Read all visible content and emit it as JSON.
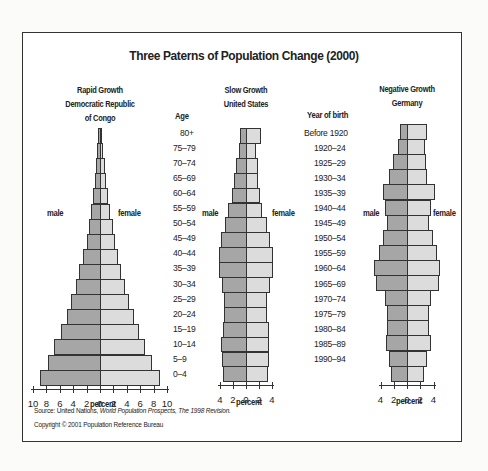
{
  "title": "Three Paterns of Population Change (2000)",
  "age_header": "Age",
  "birth_header": "Year of birth",
  "source_prefix": "Source: United Nations, ",
  "source_italic": "World Population Prospects, The 1998 Revision.",
  "copyright": "Copyright © 2001 Population Reference Bureau",
  "chart_data": [
    {
      "type": "bar",
      "orientation": "horizontal-population-pyramid",
      "title": "Rapid Growth",
      "subtitle": "Democratic Republic of Congo",
      "subtitle_lines": [
        "Rapid Growth",
        "Democratic Republic",
        "of Congo"
      ],
      "xlabel": "percent",
      "male_label": "male",
      "female_label": "female",
      "xlim": [
        -10,
        10
      ],
      "xticks": [
        "10",
        "8",
        "6",
        "4",
        "2",
        "0",
        "2",
        "4",
        "6",
        "8",
        "10"
      ],
      "categories": [
        "80+",
        "75–79",
        "70–74",
        "65–69",
        "60–64",
        "55–59",
        "50–54",
        "45–49",
        "40–44",
        "35–39",
        "30–34",
        "25–29",
        "20–24",
        "15–19",
        "10–14",
        "5–9",
        "0–4"
      ],
      "series": [
        {
          "name": "male",
          "color": "#a6a6a6",
          "values": [
            0.3,
            0.4,
            0.6,
            0.8,
            1.1,
            1.3,
            1.7,
            2.0,
            2.5,
            3.1,
            3.6,
            4.3,
            5.0,
            5.8,
            6.8,
            7.8,
            9.0
          ]
        },
        {
          "name": "female",
          "color": "#dcdcdc",
          "values": [
            0.3,
            0.5,
            0.7,
            0.9,
            1.2,
            1.5,
            1.9,
            2.2,
            2.7,
            3.2,
            3.7,
            4.3,
            5.0,
            5.8,
            6.7,
            7.7,
            8.9
          ]
        }
      ]
    },
    {
      "type": "bar",
      "orientation": "horizontal-population-pyramid",
      "title": "Slow Growth",
      "subtitle": "United States",
      "subtitle_lines": [
        "Slow Growth",
        "United States"
      ],
      "xlabel": "percent",
      "male_label": "male",
      "female_label": "female",
      "xlim": [
        -4,
        4
      ],
      "xticks": [
        "4",
        "2",
        "0",
        "2",
        "4"
      ],
      "categories": [
        "80+",
        "75–79",
        "70–74",
        "65–69",
        "60–64",
        "55–59",
        "50–54",
        "45–49",
        "40–44",
        "35–39",
        "30–34",
        "25–29",
        "20–24",
        "15–19",
        "10–14",
        "5–9",
        "0–4"
      ],
      "series": [
        {
          "name": "male",
          "color": "#a6a6a6",
          "values": [
            1.0,
            1.2,
            1.5,
            1.7,
            2.0,
            2.3,
            3.0,
            3.5,
            4.1,
            4.1,
            3.6,
            3.4,
            3.4,
            3.6,
            3.8,
            3.7,
            3.5
          ]
        },
        {
          "name": "female",
          "color": "#dcdcdc",
          "values": [
            2.1,
            1.5,
            1.8,
            1.9,
            2.1,
            2.4,
            3.0,
            3.5,
            4.1,
            4.1,
            3.6,
            3.4,
            3.3,
            3.5,
            3.6,
            3.5,
            3.4
          ]
        }
      ]
    },
    {
      "type": "bar",
      "orientation": "horizontal-population-pyramid",
      "title": "Negative Growth",
      "subtitle": "Germany",
      "subtitle_lines": [
        "Negative Growth",
        "Germany"
      ],
      "xlabel": "percent",
      "male_label": "male",
      "female_label": "female",
      "xlim": [
        -4,
        4
      ],
      "xticks": [
        "4",
        "2",
        "0",
        "2",
        "4"
      ],
      "row_labels_title": "Year of birth",
      "categories": [
        "Before 1920",
        "1920–24",
        "1925–29",
        "1930–34",
        "1935–39",
        "1940–44",
        "1945–49",
        "1950–54",
        "1955–59",
        "1960–64",
        "1965–69",
        "1970–74",
        "1975–79",
        "1980–84",
        "1985–89",
        "1990–94",
        "1995–99"
      ],
      "series": [
        {
          "name": "male",
          "color": "#a6a6a6",
          "values": [
            1.3,
            1.6,
            2.3,
            2.8,
            4.0,
            3.8,
            3.5,
            4.0,
            4.5,
            5.2,
            5.0,
            3.7,
            3.4,
            3.3,
            3.4,
            3.0,
            2.6
          ]
        },
        {
          "name": "female",
          "color": "#dcdcdc",
          "values": [
            3.1,
            2.7,
            2.9,
            3.1,
            4.0,
            3.7,
            3.4,
            4.0,
            4.4,
            5.0,
            4.8,
            3.6,
            3.2,
            3.1,
            3.3,
            2.9,
            2.5
          ]
        }
      ]
    }
  ],
  "display": {
    "congo": {
      "male": [
        0.3,
        0.4,
        0.6,
        0.8,
        1.1,
        1.3,
        1.7,
        2.0,
        2.5,
        3.1,
        3.6,
        4.3,
        5.0,
        5.8,
        6.8,
        7.8,
        9.0
      ],
      "female": [
        0.3,
        0.5,
        0.7,
        0.9,
        1.2,
        1.5,
        1.9,
        2.2,
        2.7,
        3.2,
        3.7,
        4.3,
        5.0,
        5.8,
        6.7,
        7.7,
        8.9
      ]
    },
    "us": {
      "male": [
        1.0,
        1.1,
        1.6,
        1.8,
        2.1,
        2.7,
        3.3,
        3.9,
        4.1,
        4.1,
        3.7,
        3.4,
        3.4,
        3.6,
        3.8,
        3.7,
        3.5
      ],
      "female": [
        2.3,
        1.5,
        1.8,
        1.8,
        2.1,
        2.5,
        3.2,
        3.7,
        4.1,
        4.1,
        3.7,
        3.3,
        3.3,
        3.5,
        3.6,
        3.6,
        3.4
      ]
    },
    "germany": {
      "male": [
        1.0,
        1.3,
        2.1,
        2.7,
        3.6,
        3.3,
        3.0,
        3.6,
        4.2,
        5.0,
        4.7,
        3.3,
        3.0,
        3.0,
        3.2,
        2.8,
        2.4
      ],
      "female": [
        3.1,
        2.7,
        2.9,
        3.1,
        4.2,
        3.7,
        3.4,
        4.0,
        4.6,
        5.0,
        4.8,
        3.6,
        3.3,
        3.3,
        3.6,
        3.0,
        2.5
      ]
    }
  }
}
